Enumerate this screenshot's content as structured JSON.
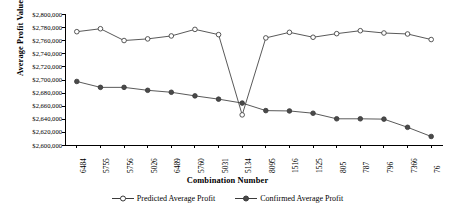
{
  "chart_data": {
    "type": "line",
    "title": "",
    "xlabel": "Combination Number",
    "ylabel": "Average Profit Value",
    "categories": [
      "6484",
      "5755",
      "5756",
      "5026",
      "6489",
      "5760",
      "5031",
      "5134",
      "8095",
      "1516",
      "1525",
      "805",
      "787",
      "796",
      "7366",
      "76"
    ],
    "ylim": [
      2600000,
      2800000
    ],
    "ytick_step": 20000,
    "yticks": [
      "$2,800,000",
      "$2,780,000",
      "$2,760,000",
      "$2,740,000",
      "$2,720,000",
      "$2,700,000",
      "$2,680,000",
      "$2,660,000",
      "$2,640,000",
      "$2,620,000",
      "$2,600,000"
    ],
    "grid": false,
    "legend_position": "bottom",
    "series": [
      {
        "name": "Predicted Average Profit",
        "marker": "open-circle",
        "values": [
          2773000,
          2777500,
          2759500,
          2762000,
          2766500,
          2776500,
          2768500,
          2646000,
          2763500,
          2772000,
          2764500,
          2770000,
          2774500,
          2771000,
          2769500,
          2761000
        ]
      },
      {
        "name": "Confirmed Average Profit",
        "marker": "filled-circle",
        "values": [
          2697000,
          2688000,
          2688000,
          2683500,
          2680500,
          2675000,
          2670000,
          2664000,
          2652500,
          2652000,
          2648500,
          2640000,
          2640000,
          2639500,
          2627000,
          2613000
        ]
      }
    ]
  },
  "legend": {
    "items": [
      {
        "label": "Predicted Average Profit"
      },
      {
        "label": "Confirmed Average Profit"
      }
    ]
  },
  "colors": {
    "line": "#3b3b3b",
    "marker_open_fill": "#ffffff",
    "marker_filled_fill": "#4a4a4a",
    "axis": "#000000",
    "background": "#ffffff"
  }
}
